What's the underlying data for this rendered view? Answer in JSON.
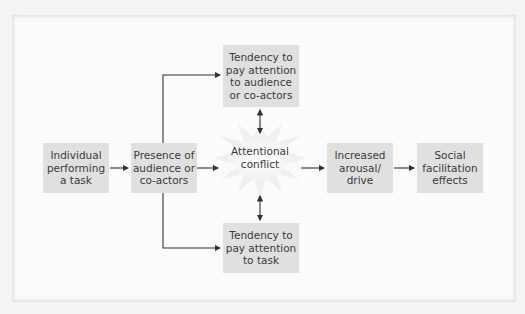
{
  "diagram": {
    "nodes": {
      "individual": "Individual performing a task",
      "presence": "Presence of audience or co-actors",
      "attend_audience": "Tendency to pay attention to audience or co-actors",
      "attend_task": "Tendency to pay attention to task",
      "conflict": "Attentional conflict",
      "arousal": "Increased arousal/ drive",
      "effects": "Social facilitation effects"
    },
    "node_lines": {
      "individual": [
        "Individual",
        "performing",
        "a task"
      ],
      "presence": [
        "Presence of",
        "audience or",
        "co-actors"
      ],
      "attend_audience": [
        "Tendency to",
        "pay attention",
        "to audience",
        "or co-actors"
      ],
      "attend_task": [
        "Tendency to",
        "pay attention",
        "to task"
      ],
      "conflict": [
        "Attentional",
        "conflict"
      ],
      "arousal": [
        "Increased",
        "arousal/",
        "drive"
      ],
      "effects": [
        "Social",
        "facilitation",
        "effects"
      ]
    },
    "edges": [
      {
        "from": "individual",
        "to": "presence",
        "type": "arrow"
      },
      {
        "from": "presence",
        "to": "attend_audience",
        "type": "arrow"
      },
      {
        "from": "presence",
        "to": "attend_task",
        "type": "arrow"
      },
      {
        "from": "presence",
        "to": "conflict",
        "type": "arrow"
      },
      {
        "from": "attend_audience",
        "to": "conflict",
        "type": "double-arrow"
      },
      {
        "from": "attend_task",
        "to": "conflict",
        "type": "double-arrow"
      },
      {
        "from": "conflict",
        "to": "arousal",
        "type": "arrow"
      },
      {
        "from": "arousal",
        "to": "effects",
        "type": "arrow"
      }
    ],
    "colors": {
      "box_fill": "#e0e0e0",
      "line": "#333333",
      "text": "#3a3a3a",
      "panel": "#fbfbfb"
    }
  }
}
